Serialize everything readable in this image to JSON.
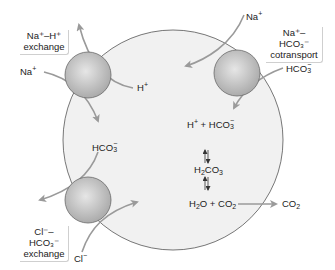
{
  "diagram": {
    "type": "cell-transport-diagram",
    "colors": {
      "cell_fill": "#f1f1f1",
      "cell_stroke": "#555555",
      "transporter_fill": "#bdbdbd",
      "transporter_stroke": "#6a6a6a",
      "arrow": "#9a9a9a",
      "text": "#222222"
    },
    "transporters": [
      {
        "id": "na-h-exchange",
        "label_line1": "Na⁺–H⁺",
        "label_line2": "exchange"
      },
      {
        "id": "na-hco3-cotransport",
        "label_line1": "Na⁺–HCO₃⁻",
        "label_line2": "cotransport"
      },
      {
        "id": "cl-hco3-exchange",
        "label_line1": "Cl⁻–HCO₃⁻",
        "label_line2": "exchange"
      }
    ],
    "ion_labels": {
      "na_in_exchange": {
        "base": "Na",
        "sup": "+"
      },
      "h_out": {
        "base": "H",
        "sup": "+"
      },
      "na_cotransport": {
        "base": "Na",
        "sup": "+"
      },
      "hco3_cotransport": {
        "base": "HCO",
        "sub": "3",
        "sup": "−"
      },
      "hco3_exchange": {
        "base": "HCO",
        "sub": "3",
        "sup": "−"
      },
      "cl_in": {
        "base": "Cl",
        "sup": "−"
      },
      "co2_out": {
        "base": "CO",
        "sub": "2"
      }
    },
    "reaction": {
      "top": {
        "h": "H",
        "h_sup": "+",
        "plus": "+",
        "hco3": "HCO",
        "hco3_sub": "3",
        "hco3_sup": "−"
      },
      "middle": {
        "h2": "H",
        "h2_sub": "2",
        "co3": "CO",
        "co3_sub": "3"
      },
      "bottom": {
        "h2o_h": "H",
        "h2o_sub": "2",
        "h2o_o": "O",
        "plus": "+",
        "co2": "CO",
        "co2_sub": "2"
      },
      "equilibrium_symbol": "⇅"
    }
  }
}
